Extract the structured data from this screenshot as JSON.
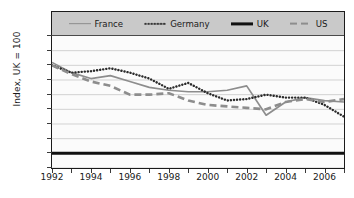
{
  "chart_data": {
    "type": "line",
    "title": "",
    "xlabel": "",
    "ylabel": "Index, UK = 100",
    "ylim": [
      95,
      140
    ],
    "xlim": [
      1992,
      2007
    ],
    "yticks": [
      95,
      100,
      105,
      110,
      115,
      120,
      125,
      130,
      135,
      140
    ],
    "xticks": [
      1992,
      1994,
      1996,
      1998,
      2000,
      2002,
      2004,
      2006
    ],
    "xticks_minor": [
      1993,
      1995,
      1997,
      1999,
      2001,
      2003,
      2005,
      2007
    ],
    "grid": true,
    "legend_position": "top",
    "x": [
      1992,
      1993,
      1994,
      1995,
      1996,
      1997,
      1998,
      1999,
      2000,
      2001,
      2002,
      2003,
      2004,
      2005,
      2006,
      2007
    ],
    "series": [
      {
        "name": "France",
        "style": "solid",
        "color": "#8d8d8d",
        "values": [
          131.0,
          127.5,
          125.5,
          126.5,
          124.5,
          122.5,
          121.5,
          121.0,
          121.0,
          121.5,
          123.0,
          113.0,
          117.5,
          119.0,
          118.0,
          117.5
        ]
      },
      {
        "name": "Germany",
        "style": "dotted",
        "color": "#2b2b2b",
        "values": [
          130.0,
          127.5,
          128.0,
          129.0,
          127.5,
          125.5,
          122.0,
          124.0,
          120.5,
          118.0,
          118.5,
          120.0,
          119.0,
          119.0,
          116.5,
          112.5
        ]
      },
      {
        "name": "UK",
        "style": "solid-thick",
        "color": "#111111",
        "values": [
          100,
          100,
          100,
          100,
          100,
          100,
          100,
          100,
          100,
          100,
          100,
          100,
          100,
          100,
          100,
          100
        ]
      },
      {
        "name": "US",
        "style": "dashed",
        "color": "#8d8d8d",
        "values": [
          130.0,
          127.0,
          124.5,
          123.0,
          120.0,
          120.0,
          120.5,
          118.0,
          116.5,
          116.0,
          115.5,
          115.0,
          117.5,
          118.5,
          117.5,
          118.5
        ]
      }
    ]
  },
  "legend": {
    "items": [
      {
        "label": "France"
      },
      {
        "label": "Germany"
      },
      {
        "label": "UK"
      },
      {
        "label": "US"
      }
    ]
  },
  "axis": {
    "y_title": "Index, UK = 100"
  }
}
